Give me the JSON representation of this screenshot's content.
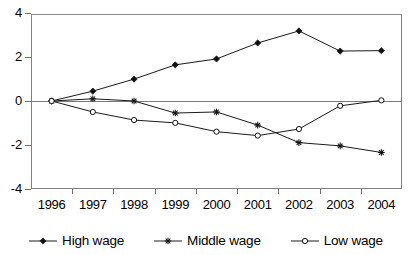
{
  "chart_data": {
    "type": "line",
    "title": "",
    "xlabel": "",
    "ylabel": "",
    "categories": [
      "1996",
      "1997",
      "1998",
      "1999",
      "2000",
      "2001",
      "2002",
      "2003",
      "2004"
    ],
    "series": [
      {
        "name": "High wage",
        "marker": "filled-diamond",
        "color": "#111111",
        "values": [
          0,
          0.45,
          1.0,
          1.65,
          1.92,
          2.65,
          3.2,
          2.28,
          2.3
        ]
      },
      {
        "name": "Middle wage",
        "marker": "asterisk",
        "color": "#111111",
        "values": [
          0,
          0.1,
          0.0,
          -0.55,
          -0.5,
          -1.1,
          -1.9,
          -2.05,
          -2.35
        ]
      },
      {
        "name": "Low wage",
        "marker": "hollow-circle",
        "color": "#111111",
        "values": [
          0,
          -0.5,
          -0.87,
          -1.0,
          -1.4,
          -1.58,
          -1.28,
          -0.22,
          0.03
        ]
      }
    ],
    "ylim": [
      -4,
      4
    ],
    "yticks": [
      4,
      2,
      0,
      -2,
      -4
    ],
    "ytick_labels": [
      "4",
      "2",
      "0",
      "-2",
      "-4"
    ],
    "grid": false,
    "zero_line": true,
    "legend_position": "bottom"
  },
  "axis": {
    "y_labels": [
      "4",
      "2",
      "0",
      "-2",
      "-4"
    ],
    "x_labels": [
      "1996",
      "1997",
      "1998",
      "1999",
      "2000",
      "2001",
      "2002",
      "2003",
      "2004"
    ]
  },
  "legend": {
    "items": [
      {
        "label": "High wage"
      },
      {
        "label": "Middle wage"
      },
      {
        "label": "Low wage"
      }
    ]
  }
}
